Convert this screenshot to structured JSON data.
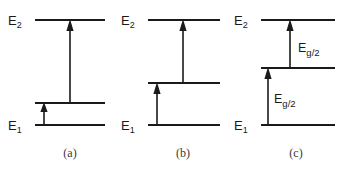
{
  "figure": {
    "type": "energy-level-diagram",
    "background_color": "#ffffff",
    "line_color": "#1a1a1a",
    "caption_color": "#3a3a3a"
  },
  "labels": {
    "upper_state": "E",
    "upper_state_sub": "2",
    "lower_state": "E",
    "lower_state_sub": "1",
    "gap_energy": "E",
    "gap_energy_sub": "g/2"
  },
  "panels": [
    {
      "id": "a",
      "caption": "(a)",
      "caption_x": 70,
      "caption_y": 157,
      "level_x0": 35,
      "level_x1": 105,
      "upper_level_y": 20,
      "lower_level_y": 125,
      "intermediate_level_y": 103,
      "intermediate_x0": 35,
      "intermediate_x1": 105,
      "upper_label_x": 8,
      "upper_label_y": 25,
      "lower_label_x": 8,
      "lower_label_y": 130,
      "transitions": [
        {
          "name": "lower-to-intermediate",
          "x": 44,
          "y_from": 125,
          "y_to": 103,
          "energy_label": null
        },
        {
          "name": "intermediate-to-upper",
          "x": 70,
          "y_from": 103,
          "y_to": 20,
          "energy_label": null
        }
      ]
    },
    {
      "id": "b",
      "caption": "(b)",
      "caption_x": 183,
      "caption_y": 157,
      "level_x0": 148,
      "level_x1": 220,
      "upper_level_y": 20,
      "lower_level_y": 125,
      "intermediate_level_y": 83,
      "intermediate_x0": 148,
      "intermediate_x1": 220,
      "upper_label_x": 121,
      "upper_label_y": 25,
      "lower_label_x": 121,
      "lower_label_y": 130,
      "transitions": [
        {
          "name": "lower-to-intermediate",
          "x": 157,
          "y_from": 125,
          "y_to": 83,
          "energy_label": null
        },
        {
          "name": "intermediate-to-upper",
          "x": 183,
          "y_from": 83,
          "y_to": 20,
          "energy_label": null
        }
      ]
    },
    {
      "id": "c",
      "caption": "(c)",
      "caption_x": 296,
      "caption_y": 157,
      "level_x0": 261,
      "level_x1": 335,
      "upper_level_y": 20,
      "lower_level_y": 125,
      "intermediate_level_y": 68,
      "intermediate_x0": 261,
      "intermediate_x1": 335,
      "upper_label_x": 234,
      "upper_label_y": 25,
      "lower_label_x": 234,
      "lower_label_y": 130,
      "transitions": [
        {
          "name": "lower-to-intermediate",
          "x": 268,
          "y_from": 125,
          "y_to": 68,
          "energy_label": "E_g/2",
          "label_x": 274,
          "label_y": 103
        },
        {
          "name": "intermediate-to-upper",
          "x": 290,
          "y_from": 68,
          "y_to": 20,
          "energy_label": "E_g/2",
          "label_x": 298,
          "label_y": 52
        }
      ]
    }
  ]
}
